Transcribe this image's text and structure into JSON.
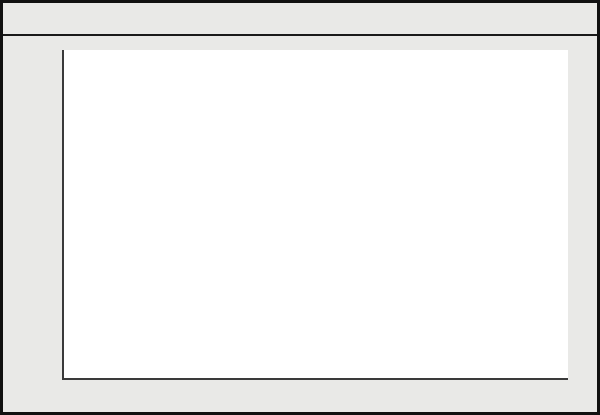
{
  "figure": {
    "background_color": "#e9e9e7",
    "plot_background_color": "#ffffff",
    "border_color": "#111111"
  },
  "chart_data": {
    "type": "area",
    "xlabel": "",
    "ylabel": "Percentage of babies breast-fed",
    "ylim": [
      0,
      100
    ],
    "ytick_labels": [
      "0",
      "10",
      "20",
      "30",
      "40",
      "50",
      "60",
      "70",
      "80",
      "90",
      "100"
    ],
    "ytick_values": [
      0,
      10,
      20,
      30,
      40,
      50,
      60,
      70,
      80,
      90,
      100
    ],
    "xtick_labels": [
      "1970-71",
      "1972-73",
      "1974-75",
      "1976-77",
      "1978-79",
      "1980-81",
      "1982-83",
      "1984-85",
      "1986-87"
    ],
    "categories": [
      "1970-71",
      "1971-72",
      "1972-73",
      "1973-74",
      "1974-75",
      "1975-76",
      "1976-77",
      "1977-78",
      "1978-79",
      "1979-80",
      "1980-81",
      "1981-82",
      "1982-83",
      "1983-84",
      "1984-85",
      "1985-86",
      "1986-87"
    ],
    "values": [
      25,
      27,
      29.5,
      32,
      34.5,
      38,
      42,
      43,
      44,
      47.5,
      51,
      54,
      57.5,
      56.5,
      55.8,
      55.6,
      55.5
    ],
    "grid": false,
    "legend": false,
    "area_fill_color": "#9a9a9a",
    "line_color": "#2b2b2b",
    "axis_color": "#3a3a3a"
  }
}
